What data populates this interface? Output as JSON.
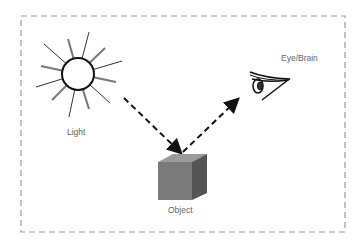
{
  "diagram": {
    "labels": {
      "light": "Light",
      "object": "Object",
      "eye": "Eye/Brain"
    },
    "colors": {
      "frame": "#9a9a9a",
      "arrow": "#111111",
      "cube_front": "#7a7a7a",
      "cube_top": "#9a9a9a",
      "cube_side": "#555555",
      "label": "#666666"
    },
    "edges": [
      {
        "from": "Light",
        "to": "Object",
        "style": "dashed-arrow"
      },
      {
        "from": "Object",
        "to": "Eye/Brain",
        "style": "dashed-arrow"
      }
    ]
  }
}
